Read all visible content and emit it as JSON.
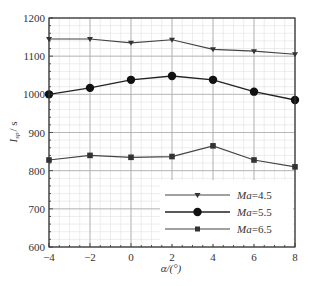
{
  "chart_data": {
    "type": "line",
    "title": "",
    "xlabel": "α/(°)",
    "ylabel": "I_sp / s",
    "ylabel_main": "I",
    "ylabel_sub": "sp",
    "ylabel_unit": "/ s",
    "x": [
      -4,
      -2,
      0,
      2,
      4,
      6,
      8
    ],
    "xlim": [
      -4,
      8
    ],
    "ylim": [
      600,
      1200
    ],
    "x_ticks": [
      "−4",
      "−2",
      "0",
      "2",
      "4",
      "6",
      "8"
    ],
    "y_ticks": [
      "600",
      "700",
      "800",
      "900",
      "1000",
      "1100",
      "1200"
    ],
    "grid": true,
    "minor_grid": true,
    "legend_position": "lower right",
    "series": [
      {
        "name": "Ma=4.5",
        "name_italic": "Ma",
        "name_value": "=4.5",
        "marker": "triangle-down",
        "values": [
          1145,
          1145,
          1135,
          1143,
          1118,
          1113,
          1105
        ]
      },
      {
        "name": "Ma=5.5",
        "name_italic": "Ma",
        "name_value": "=5.5",
        "marker": "circle",
        "values": [
          1000,
          1017,
          1038,
          1048,
          1038,
          1007,
          985
        ]
      },
      {
        "name": "Ma=6.5",
        "name_italic": "Ma",
        "name_value": "=6.5",
        "marker": "square",
        "values": [
          828,
          840,
          835,
          837,
          865,
          828,
          810
        ]
      }
    ]
  },
  "colors": {
    "line": "#444444",
    "grid_major": "#aaaaaa",
    "grid_minor": "#e0e0e0",
    "axis": "#333333"
  }
}
